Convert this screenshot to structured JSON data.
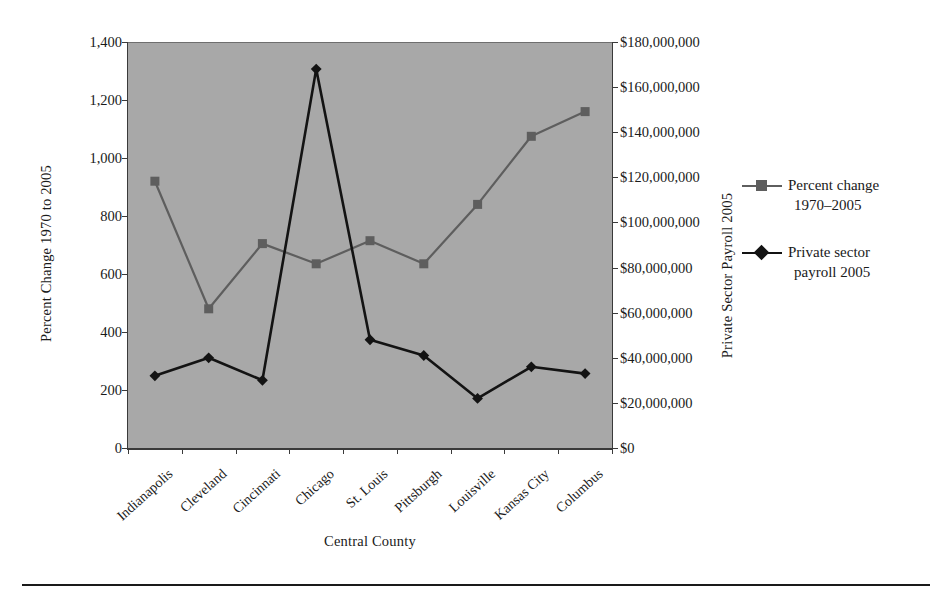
{
  "chart_data": {
    "type": "line",
    "title": "",
    "xlabel": "Central County",
    "ylabel": "Percent Change 1970 to 2005",
    "ylabel_right": "Private Sector Payroll 2005",
    "categories": [
      "Indianapolis",
      "Cleveland",
      "Cincinnati",
      "Chicago",
      "St. Louis",
      "Pittsburgh",
      "Louisville",
      "Kansas City",
      "Columbus"
    ],
    "ylim": [
      0,
      1400
    ],
    "ylim_right": [
      0,
      180000000
    ],
    "ytick_labels": [
      "1,400",
      "1,200",
      "1,000",
      "800",
      "600",
      "400",
      "200",
      "0"
    ],
    "ytick_values": [
      1400,
      1200,
      1000,
      800,
      600,
      400,
      200,
      0
    ],
    "ytick_labels_right": [
      "$180,000,000",
      "$160,000,000",
      "$140,000,000",
      "$120,000,000",
      "$100,000,000",
      "$80,000,000",
      "$60,000,000",
      "$40,000,000",
      "$20,000,000",
      "$0"
    ],
    "ytick_values_right": [
      180000000,
      160000000,
      140000000,
      120000000,
      100000000,
      80000000,
      60000000,
      40000000,
      20000000,
      0
    ],
    "grid": false,
    "legend_position": "right",
    "plot_background": "#a8a8a8",
    "series": [
      {
        "name": "Percent change 1970–2005",
        "axis": "left",
        "color": "#5e5e5e",
        "marker": "square",
        "values": [
          920,
          480,
          705,
          635,
          715,
          635,
          840,
          1075,
          1160
        ]
      },
      {
        "name": "Private sector payroll 2005",
        "axis": "right",
        "color": "#131313",
        "marker": "diamond",
        "values": [
          32000000,
          40000000,
          30000000,
          168000000,
          48000000,
          41000000,
          22000000,
          36000000,
          33000000
        ]
      }
    ]
  },
  "legend": {
    "items": [
      {
        "line1": "Percent change",
        "line2": "1970–2005",
        "marker": "square-marker-icon",
        "color": "#5e5e5e"
      },
      {
        "line1": "Private sector",
        "line2": "payroll 2005",
        "marker": "diamond-marker-icon",
        "color": "#131313"
      }
    ]
  },
  "axes": {
    "left_title": "Percent Change 1970 to 2005",
    "right_title": "Private Sector Payroll 2005",
    "bottom_title": "Central County"
  }
}
